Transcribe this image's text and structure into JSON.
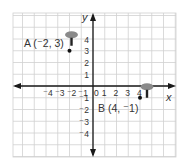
{
  "chart_data": {
    "type": "scatter",
    "title": "",
    "xlabel": "x",
    "ylabel": "y",
    "xlim": [
      -6.5,
      7
    ],
    "ylim": [
      -6,
      6
    ],
    "grid": true,
    "x_tick_labels": [
      "⁻4",
      "⁻3",
      "⁻2",
      "⁻1",
      "0",
      "1",
      "2",
      "3",
      "4"
    ],
    "y_tick_labels": [
      "4",
      "3",
      "2",
      "1",
      "⁻1",
      "⁻2",
      "⁻3",
      "⁻4"
    ],
    "points": [
      {
        "name": "A",
        "x": -2,
        "y": 3,
        "label": "A (⁻2, 3)"
      },
      {
        "name": "B",
        "x": 4,
        "y": -1,
        "label": "B (4, ⁻1)"
      }
    ]
  },
  "axes": {
    "x_label": "x",
    "y_label": "y",
    "origin_label": "0"
  },
  "colors": {
    "grid": "#d0d0d0",
    "axis": "#1a1a1a",
    "pin": "#8a8a8a",
    "point": "#111111",
    "text": "#333333"
  }
}
